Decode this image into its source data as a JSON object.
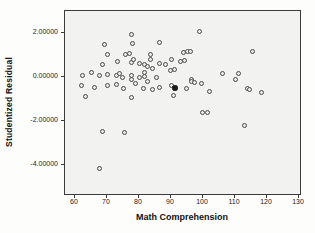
{
  "chart_data": {
    "type": "scatter",
    "title": "",
    "xlabel": "Math Comprehension",
    "ylabel": "Studentized Residual",
    "x_ticks": [
      {
        "value": 60,
        "label": "60"
      },
      {
        "value": 70,
        "label": "70"
      },
      {
        "value": 80,
        "label": "80"
      },
      {
        "value": 90,
        "label": "90"
      },
      {
        "value": 100,
        "label": "100"
      },
      {
        "value": 110,
        "label": "110"
      },
      {
        "value": 120,
        "label": "120"
      },
      {
        "value": 130,
        "label": "130"
      }
    ],
    "y_ticks": [
      {
        "value": 2,
        "label": "2.00000"
      },
      {
        "value": 0,
        "label": "0.00000"
      },
      {
        "value": -2,
        "label": "-2.00000"
      },
      {
        "value": -4,
        "label": "-4.00000"
      }
    ],
    "xlim": [
      56.9,
      131.3
    ],
    "ylim": [
      -5.3,
      3.0
    ],
    "grid": false,
    "legend": "none",
    "marker": "hollow-circle",
    "points": [
      [
        77.7,
        1.97
      ],
      [
        99.0,
        2.08
      ],
      [
        69.2,
        1.53
      ],
      [
        78.0,
        1.56
      ],
      [
        86.3,
        1.6
      ],
      [
        115.6,
        1.17
      ],
      [
        70.3,
        1.05
      ],
      [
        75.8,
        1.04
      ],
      [
        76.9,
        1.12
      ],
      [
        83.6,
        1.06
      ],
      [
        83.6,
        0.81
      ],
      [
        90.3,
        0.84
      ],
      [
        94.0,
        1.13
      ],
      [
        95.3,
        1.19
      ],
      [
        96.2,
        1.17
      ],
      [
        94.1,
        0.77
      ],
      [
        92.9,
        0.74
      ],
      [
        68.6,
        0.62
      ],
      [
        73.3,
        0.73
      ],
      [
        77.5,
        0.7
      ],
      [
        78.3,
        0.82
      ],
      [
        80.2,
        0.64
      ],
      [
        81.6,
        0.59
      ],
      [
        82.6,
        0.5
      ],
      [
        84.2,
        0.4
      ],
      [
        86.3,
        0.66
      ],
      [
        88.3,
        0.62
      ],
      [
        89.7,
        0.33
      ],
      [
        91.0,
        0.36
      ],
      [
        62.3,
        0.09
      ],
      [
        65.2,
        0.23
      ],
      [
        67.5,
        0.11
      ],
      [
        70.1,
        0.14
      ],
      [
        72.9,
        0.09
      ],
      [
        73.8,
        0.17
      ],
      [
        74.8,
        -0.01
      ],
      [
        77.6,
        0.09
      ],
      [
        77.6,
        -0.07
      ],
      [
        80.2,
        -0.01
      ],
      [
        81.6,
        0.23
      ],
      [
        81.6,
        0.07
      ],
      [
        85.6,
        -0.01
      ],
      [
        96.3,
        -0.08
      ],
      [
        106.2,
        0.18
      ],
      [
        111.2,
        0.17
      ],
      [
        110.0,
        -0.07
      ],
      [
        62.0,
        -0.36
      ],
      [
        66.2,
        -0.44
      ],
      [
        70.3,
        -0.36
      ],
      [
        72.9,
        -0.32
      ],
      [
        75.0,
        -0.51
      ],
      [
        79.0,
        -0.26
      ],
      [
        82.5,
        -0.17
      ],
      [
        81.5,
        -0.5
      ],
      [
        84.3,
        -0.53
      ],
      [
        86.3,
        -0.46
      ],
      [
        90.3,
        -0.34
      ],
      [
        94.7,
        -0.5
      ],
      [
        96.5,
        -0.19
      ],
      [
        97.3,
        -0.23
      ],
      [
        99.4,
        -0.27
      ],
      [
        102.0,
        -0.64
      ],
      [
        113.8,
        -0.5
      ],
      [
        114.6,
        -0.54
      ],
      [
        118.4,
        -0.69
      ],
      [
        63.2,
        -0.84
      ],
      [
        77.6,
        -0.91
      ],
      [
        90.8,
        -0.82
      ],
      [
        99.7,
        -1.56
      ],
      [
        101.3,
        -1.56
      ],
      [
        112.9,
        -2.19
      ],
      [
        68.5,
        -2.44
      ],
      [
        75.5,
        -2.5
      ],
      [
        67.5,
        -4.11
      ]
    ],
    "dark_point": [
      90.8,
      -0.43
    ],
    "x_scale": {
      "v0": 60,
      "px0": 10,
      "px_per_unit": 3.2
    },
    "y_scale": {
      "v0": 0,
      "px0": 66.7,
      "px_per_unit": -22
    },
    "plot_box": {
      "left": 64,
      "top": 10,
      "width": 237,
      "height": 185
    },
    "colors": {
      "plot_bg": "#f2f2f0",
      "frame": "#3b3b3b",
      "point_ring": "#4a4a4a",
      "point_fill": "#ebebe9",
      "dark_point": "#1a1a1a",
      "label_text": "#222222",
      "title_text": "#121212"
    }
  }
}
